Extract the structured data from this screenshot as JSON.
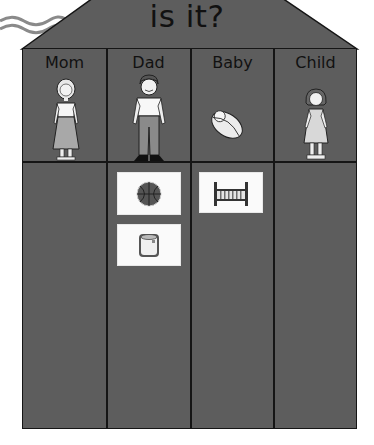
{
  "title": "is it?",
  "colors": {
    "house_fill": "#5d5d5d",
    "line": "#151515",
    "card_fill": "#fafafa",
    "wave": "#8a8a8a"
  },
  "columns": [
    {
      "label": "Mom",
      "figure": "woman-icon",
      "items": []
    },
    {
      "label": "Dad",
      "figure": "man-icon",
      "items": [
        {
          "name": "basketball-icon"
        },
        {
          "name": "paint-can-icon"
        }
      ]
    },
    {
      "label": "Baby",
      "figure": "swaddled-baby-icon",
      "items": [
        {
          "name": "crib-icon"
        }
      ]
    },
    {
      "label": "Child",
      "figure": "girl-icon",
      "items": []
    }
  ]
}
